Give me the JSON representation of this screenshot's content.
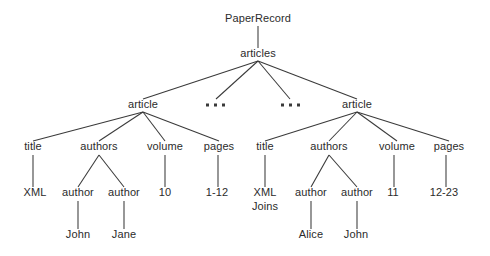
{
  "diagram": {
    "type": "tree",
    "background_color": "#ffffff",
    "line_color": "#3a3a3a",
    "text_color": "#2b2b2b",
    "nodes": [
      {
        "id": "root",
        "label": "PaperRecord",
        "x": 258,
        "y": 22
      },
      {
        "id": "articles",
        "label": "articles",
        "x": 258,
        "y": 57
      },
      {
        "id": "article1",
        "label": "article",
        "x": 143,
        "y": 108
      },
      {
        "id": "ellipsis1",
        "label": "...",
        "x": 215,
        "y": 108
      },
      {
        "id": "ellipsis2",
        "label": "...",
        "x": 290,
        "y": 108
      },
      {
        "id": "article2",
        "label": "article",
        "x": 357,
        "y": 108
      },
      {
        "id": "a1-title",
        "label": "title",
        "x": 33,
        "y": 150
      },
      {
        "id": "a1-authors",
        "label": "authors",
        "x": 99,
        "y": 150
      },
      {
        "id": "a1-volume",
        "label": "volume",
        "x": 165,
        "y": 150
      },
      {
        "id": "a1-pages",
        "label": "pages",
        "x": 219,
        "y": 150
      },
      {
        "id": "a1-xml",
        "label": "XML",
        "x": 35,
        "y": 196
      },
      {
        "id": "a1-author1",
        "label": "author",
        "x": 78,
        "y": 196
      },
      {
        "id": "a1-author2",
        "label": "author",
        "x": 124,
        "y": 196
      },
      {
        "id": "a1-vol-val",
        "label": "10",
        "x": 165,
        "y": 196
      },
      {
        "id": "a1-pg-val",
        "label": "1-12",
        "x": 217,
        "y": 196
      },
      {
        "id": "a1-john",
        "label": "John",
        "x": 78,
        "y": 238
      },
      {
        "id": "a1-jane",
        "label": "Jane",
        "x": 124,
        "y": 238
      },
      {
        "id": "a2-title",
        "label": "title",
        "x": 265,
        "y": 150
      },
      {
        "id": "a2-authors",
        "label": "authors",
        "x": 329,
        "y": 150
      },
      {
        "id": "a2-volume",
        "label": "volume",
        "x": 397,
        "y": 150
      },
      {
        "id": "a2-pages",
        "label": "pages",
        "x": 449,
        "y": 150
      },
      {
        "id": "a2-xml1",
        "label": "XML",
        "x": 265,
        "y": 196
      },
      {
        "id": "a2-xml2",
        "label": "Joins",
        "x": 265,
        "y": 210
      },
      {
        "id": "a2-author1",
        "label": "author",
        "x": 311,
        "y": 196
      },
      {
        "id": "a2-author2",
        "label": "author",
        "x": 357,
        "y": 196
      },
      {
        "id": "a2-vol-val",
        "label": "11",
        "x": 393,
        "y": 196
      },
      {
        "id": "a2-pg-val",
        "label": "12-23",
        "x": 444,
        "y": 196
      },
      {
        "id": "a2-alice",
        "label": "Alice",
        "x": 311,
        "y": 238
      },
      {
        "id": "a2-john",
        "label": "John",
        "x": 356,
        "y": 238
      }
    ],
    "edges": [
      {
        "from": "root",
        "to": "articles",
        "x1": 258,
        "y1": 26,
        "x2": 258,
        "y2": 48
      },
      {
        "from": "articles",
        "to": "article1",
        "x1": 258,
        "y1": 61,
        "x2": 143,
        "y2": 99
      },
      {
        "from": "articles",
        "to": "ellipsis1",
        "x1": 258,
        "y1": 61,
        "x2": 216,
        "y2": 99
      },
      {
        "from": "articles",
        "to": "ellipsis2",
        "x1": 258,
        "y1": 61,
        "x2": 290,
        "y2": 99
      },
      {
        "from": "articles",
        "to": "article2",
        "x1": 258,
        "y1": 61,
        "x2": 357,
        "y2": 99
      },
      {
        "from": "article1",
        "to": "a1-title",
        "x1": 143,
        "y1": 112,
        "x2": 33,
        "y2": 141
      },
      {
        "from": "article1",
        "to": "a1-authors",
        "x1": 143,
        "y1": 112,
        "x2": 99,
        "y2": 141
      },
      {
        "from": "article1",
        "to": "a1-volume",
        "x1": 143,
        "y1": 112,
        "x2": 165,
        "y2": 141
      },
      {
        "from": "article1",
        "to": "a1-pages",
        "x1": 143,
        "y1": 112,
        "x2": 219,
        "y2": 141
      },
      {
        "from": "a1-title",
        "to": "a1-xml",
        "x1": 33,
        "y1": 155,
        "x2": 33,
        "y2": 187
      },
      {
        "from": "a1-authors",
        "to": "a1-author1",
        "x1": 99,
        "y1": 155,
        "x2": 78,
        "y2": 187
      },
      {
        "from": "a1-authors",
        "to": "a1-author2",
        "x1": 99,
        "y1": 155,
        "x2": 124,
        "y2": 187
      },
      {
        "from": "a1-volume",
        "to": "a1-vol-val",
        "x1": 165,
        "y1": 155,
        "x2": 165,
        "y2": 187
      },
      {
        "from": "a1-pages",
        "to": "a1-pg-val",
        "x1": 218,
        "y1": 155,
        "x2": 218,
        "y2": 187
      },
      {
        "from": "a1-author1",
        "to": "a1-john",
        "x1": 78,
        "y1": 201,
        "x2": 78,
        "y2": 229
      },
      {
        "from": "a1-author2",
        "to": "a1-jane",
        "x1": 124,
        "y1": 201,
        "x2": 124,
        "y2": 229
      },
      {
        "from": "article2",
        "to": "a2-title",
        "x1": 357,
        "y1": 112,
        "x2": 265,
        "y2": 141
      },
      {
        "from": "article2",
        "to": "a2-authors",
        "x1": 357,
        "y1": 112,
        "x2": 329,
        "y2": 141
      },
      {
        "from": "article2",
        "to": "a2-volume",
        "x1": 357,
        "y1": 112,
        "x2": 397,
        "y2": 141
      },
      {
        "from": "article2",
        "to": "a2-pages",
        "x1": 357,
        "y1": 112,
        "x2": 449,
        "y2": 141
      },
      {
        "from": "a2-title",
        "to": "a2-xml1",
        "x1": 265,
        "y1": 155,
        "x2": 265,
        "y2": 187
      },
      {
        "from": "a2-authors",
        "to": "a2-author1",
        "x1": 329,
        "y1": 155,
        "x2": 311,
        "y2": 187
      },
      {
        "from": "a2-authors",
        "to": "a2-author2",
        "x1": 329,
        "y1": 155,
        "x2": 357,
        "y2": 187
      },
      {
        "from": "a2-volume",
        "to": "a2-vol-val",
        "x1": 394,
        "y1": 155,
        "x2": 394,
        "y2": 187
      },
      {
        "from": "a2-pages",
        "to": "a2-pg-val",
        "x1": 446,
        "y1": 155,
        "x2": 446,
        "y2": 187
      },
      {
        "from": "a2-author1",
        "to": "a2-alice",
        "x1": 311,
        "y1": 201,
        "x2": 311,
        "y2": 229
      },
      {
        "from": "a2-author2",
        "to": "a2-john",
        "x1": 357,
        "y1": 201,
        "x2": 357,
        "y2": 229
      }
    ],
    "ellipsis_groups": [
      {
        "id": "ellipsis1",
        "cx": 215,
        "cy": 105,
        "dots": 3
      },
      {
        "id": "ellipsis2",
        "cx": 290,
        "cy": 105,
        "dots": 3
      }
    ]
  }
}
